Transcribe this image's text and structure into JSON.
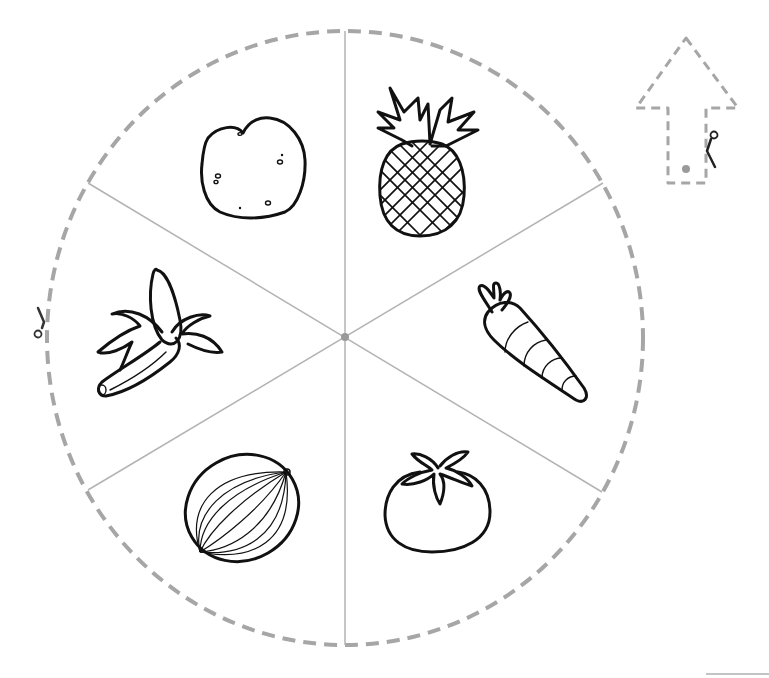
{
  "worksheet": {
    "wheel": {
      "center": [
        345,
        338
      ],
      "radius_x": 298,
      "radius_y": 307,
      "outline_style": "dashed",
      "outline_color": "#a6a6a6",
      "spoke_color": "#b3b3b3",
      "segments": 6,
      "items": [
        {
          "name": "potato",
          "position": "top-left"
        },
        {
          "name": "pineapple",
          "position": "top-right"
        },
        {
          "name": "carrot",
          "position": "right"
        },
        {
          "name": "tomato",
          "position": "bottom-right"
        },
        {
          "name": "watermelon",
          "position": "bottom-left"
        },
        {
          "name": "banana",
          "position": "left"
        }
      ]
    },
    "pointer": {
      "shape": "arrow-up",
      "outline_style": "dashed",
      "outline_color": "#a6a6a6",
      "pin_color": "#9a9a9a"
    },
    "cut_marks": [
      {
        "icon": "scissors-icon",
        "location": "wheel-left-edge"
      },
      {
        "icon": "scissors-icon",
        "location": "arrow-right-edge"
      }
    ]
  }
}
